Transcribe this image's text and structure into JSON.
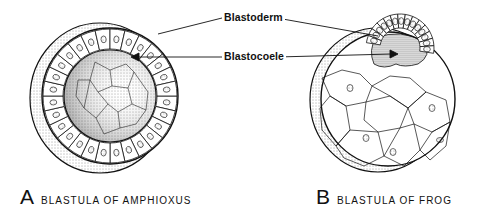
{
  "labels": {
    "blastoderm": "Blastoderm",
    "blastocoele": "Blastocoele"
  },
  "figures": [
    {
      "letter": "A",
      "caption": "BLASTULA OF AMPHIOXUS"
    },
    {
      "letter": "B",
      "caption": "BLASTULA OF FROG"
    }
  ],
  "colors": {
    "ink": "#111111",
    "background": "#ffffff",
    "stipple": "#777777"
  }
}
